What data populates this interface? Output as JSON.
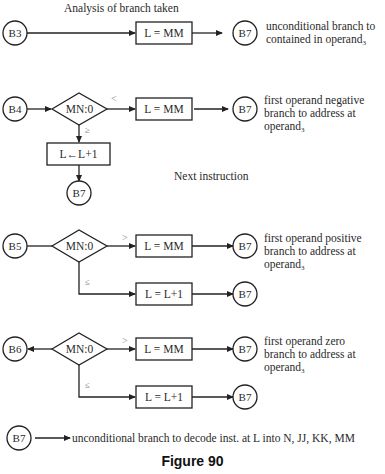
{
  "title": "Analysis of branch taken",
  "subtitle": "Next instruction",
  "caption": "Figure 90",
  "sections": [
    {
      "entry": "B3",
      "box": "L = MM",
      "target": "B7",
      "description": [
        "unconditional branch to",
        "contained in operand"
      ],
      "subscript": "3"
    },
    {
      "entry": "B4",
      "decision": "MN:0",
      "true_cond": "<",
      "false_cond": "≥",
      "box_true": "L = MM",
      "target_true": "B7",
      "box_false": "L←L+1",
      "target_false": "B7",
      "description": [
        "first operand negative",
        "branch to address at",
        "operand"
      ],
      "subscript": "3"
    },
    {
      "entry": "B5",
      "decision": "MN:0",
      "true_cond": ">",
      "false_cond": "≤",
      "box_true": "L = MM",
      "target_true": "B7",
      "box_false": "L = L+1",
      "target_false": "B7",
      "description": [
        "first operand positive",
        "branch to address at",
        "operand"
      ],
      "subscript": "3"
    },
    {
      "entry": "B6",
      "decision": "MN:0",
      "true_cond": ">",
      "false_cond": "≤",
      "box_true": "L = MM",
      "target_true": "B7",
      "box_false": "L = L+1",
      "target_false": "B7",
      "description": [
        "first operand zero",
        "branch to address at",
        "operand"
      ],
      "subscript": "3"
    }
  ],
  "footer": {
    "node": "B7",
    "text": "unconditional branch to decode inst. at L into N, JJ, KK, MM"
  }
}
